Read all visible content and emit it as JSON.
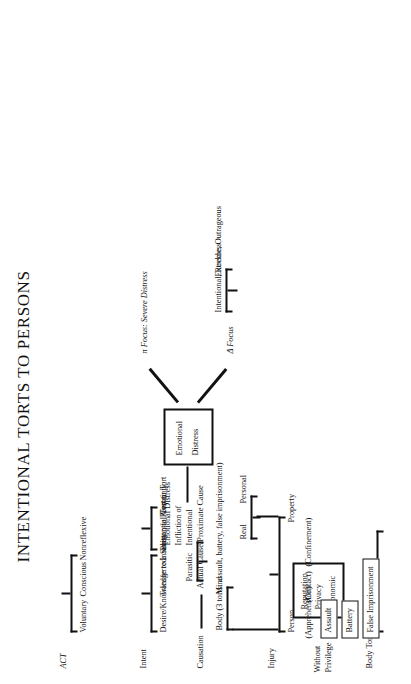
{
  "title": "INTENTIONAL TORTS TO PERSONS",
  "groups": {
    "act": {
      "root": "ACT",
      "children": [
        "Voluntary",
        "Conscious",
        "Nonreflexive"
      ]
    },
    "intent": {
      "root": "Intent",
      "children": [
        "Desire/Knowledge to a Substantial Certainty",
        "Transferred",
        "Insanity"
      ],
      "transferred_children": [
        "Person to Person",
        "Tort to Tort"
      ]
    },
    "causation": {
      "root": "Causation",
      "children": [
        "Actual Cause/Proximate Cause"
      ]
    },
    "injury": {
      "root": "Injury",
      "children": [
        "Person",
        "Property"
      ],
      "person_children": [
        "Body (3 torts: assault, battery, false imprisonment)",
        "Mind"
      ],
      "person_box": [
        "Reputation",
        "Privacy",
        "Economic"
      ],
      "property_children": [
        "Real",
        "Personal"
      ],
      "mind_children": [
        "Parasitic",
        "Intentional\nInfliction of\nEmotional Distress"
      ],
      "mind_child_1_lines": [
        "Intentional",
        "Infliction of",
        "Emotional Distress"
      ]
    },
    "emotional_distress": {
      "box_lines": [
        "Emotional",
        "Distress"
      ],
      "branches": [
        {
          "label": "π Focus: Severe Distress"
        },
        {
          "label": "Δ Focus",
          "children": [
            "Intentional, Reckless",
            "Extreme, Outrageous"
          ]
        }
      ]
    },
    "without_privilege": {
      "root_lines": [
        "Without",
        "Privilege"
      ]
    },
    "body_torts": {
      "root": "Body Torts",
      "items": [
        {
          "name": "Assault",
          "note": "(Apprehension)"
        },
        {
          "name": "Battery",
          "note": "(Contact)"
        },
        {
          "name": "False Imprisonment",
          "note": "(Confinement)"
        }
      ]
    }
  },
  "colors": {
    "ink": "#111111",
    "paper": "#ffffff"
  }
}
